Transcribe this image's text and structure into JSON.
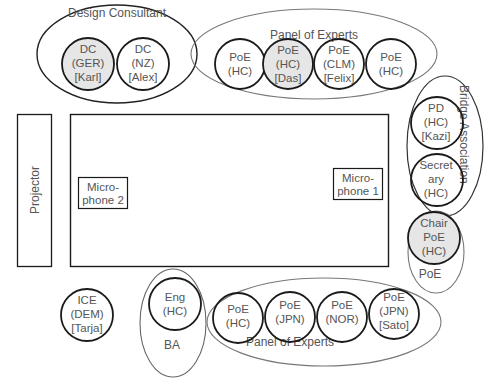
{
  "groups": {
    "design_consultant": {
      "label": "Design Consultant"
    },
    "panel_top": {
      "label": "Panel of Experts"
    },
    "bridge_association": {
      "label": "Bridge Association"
    },
    "poe_chair_group": {
      "label": "PoE"
    },
    "ba_group": {
      "label": "BA"
    },
    "panel_bottom": {
      "label": "Panel of Experts"
    }
  },
  "equipment": {
    "projector": {
      "label": "Projector"
    },
    "mic2": {
      "line1": "Micro-",
      "line2": "phone 2"
    },
    "mic1": {
      "line1": "Micro-",
      "line2": "phone 1"
    }
  },
  "people": {
    "dc_ger": {
      "lines": [
        "DC",
        "(GER)",
        "[Karl]"
      ],
      "highlighted": true
    },
    "dc_nz": {
      "lines": [
        "DC",
        "(NZ)",
        "[Alex]"
      ],
      "highlighted": false
    },
    "poe_top_1": {
      "lines": [
        "PoE",
        "(HC)"
      ],
      "highlighted": false
    },
    "poe_top_2": {
      "lines": [
        "PoE",
        "(HC)",
        "[Das]"
      ],
      "highlighted": true
    },
    "poe_top_3": {
      "lines": [
        "PoE",
        "(CLM)",
        "[Felix]"
      ],
      "highlighted": false
    },
    "poe_top_4": {
      "lines": [
        "PoE",
        "(HC)"
      ],
      "highlighted": false
    },
    "pd": {
      "lines": [
        "PD",
        "(HC)",
        "[Kazi]"
      ],
      "highlighted": false
    },
    "secretary": {
      "lines": [
        "Secret",
        "ary",
        "(HC)"
      ],
      "highlighted": false
    },
    "chair": {
      "lines": [
        "Chair",
        "PoE",
        "(HC)"
      ],
      "highlighted": true
    },
    "ice": {
      "lines": [
        "ICE",
        "(DEM)",
        "[Tarja]"
      ],
      "highlighted": false
    },
    "eng": {
      "lines": [
        "Eng",
        "(HC)"
      ],
      "highlighted": false
    },
    "poe_bot_1": {
      "lines": [
        "PoE",
        "(HC)"
      ],
      "highlighted": false
    },
    "poe_bot_2": {
      "lines": [
        "PoE",
        "(JPN)"
      ],
      "highlighted": false
    },
    "poe_bot_3": {
      "lines": [
        "PoE",
        "(NOR)"
      ],
      "highlighted": false
    },
    "poe_bot_4": {
      "lines": [
        "PoE",
        "(JPN)",
        "[Sato]"
      ],
      "highlighted": false
    }
  },
  "colors": {
    "stroke_dark": "#1a1a1a",
    "stroke_group": "#666666",
    "highlight_fill": "#e6e6e6",
    "text": "#555555"
  }
}
